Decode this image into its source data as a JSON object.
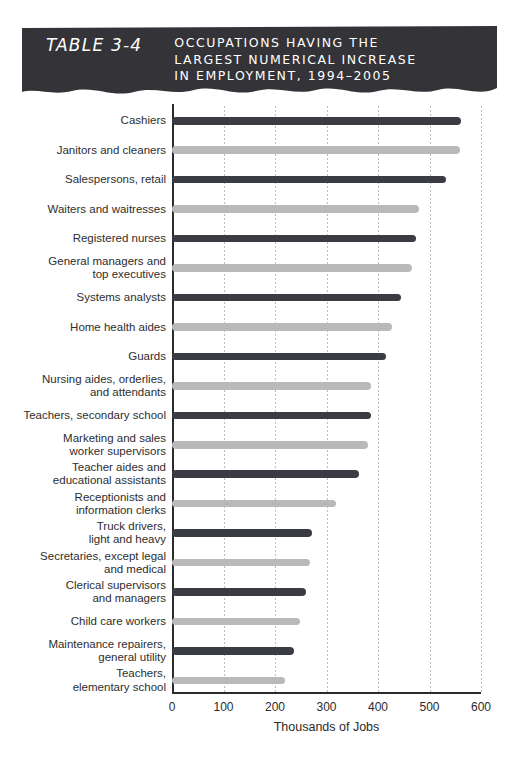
{
  "banner": {
    "label": "TABLE 3-4",
    "title_lines": [
      "OCCUPATIONS HAVING THE",
      "LARGEST NUMERICAL INCREASE",
      "IN EMPLOYMENT, 1994–2005"
    ],
    "background_color": "#333338",
    "text_color": "#ffffff"
  },
  "chart_data": {
    "type": "bar",
    "orientation": "horizontal",
    "title": "OCCUPATIONS HAVING THE LARGEST NUMERICAL INCREASE IN EMPLOYMENT, 1994–2005",
    "xlabel": "Thousands of Jobs",
    "ylabel": "",
    "xlim": [
      0,
      600
    ],
    "xticks": [
      0,
      100,
      200,
      300,
      400,
      500,
      600
    ],
    "xtick_labels": [
      "0",
      "100",
      "200",
      "300",
      "400",
      "500",
      "600"
    ],
    "grid": "vertical-dotted",
    "legend": "none",
    "colors": {
      "dark": "#3a3b43",
      "light": "#b9b9b9",
      "axis": "#2b2b2b",
      "gridline": "#bdbdbd",
      "background": "#ffffff"
    },
    "categories": [
      "Cashiers",
      "Janitors and cleaners",
      "Salespersons, retail",
      "Waiters and waitresses",
      "Registered nurses",
      "General managers and top executives",
      "Systems analysts",
      "Home health aides",
      "Guards",
      "Nursing aides, orderlies, and attendants",
      "Teachers, secondary school",
      "Marketing and sales worker supervisors",
      "Teacher aides and educational assistants",
      "Receptionists and information clerks",
      "Truck drivers, light and heavy",
      "Secretaries, except legal and medical",
      "Clerical supervisors and managers",
      "Child care workers",
      "Maintenance repairers, general utility",
      "Teachers, elementary school"
    ],
    "values": [
      562,
      559,
      532,
      479,
      473,
      466,
      445,
      428,
      415,
      387,
      386,
      380,
      364,
      318,
      271,
      267,
      261,
      248,
      236,
      220
    ]
  },
  "rows": [
    {
      "label_lines": [
        "Cashiers"
      ],
      "value": 562,
      "shade": "dark"
    },
    {
      "label_lines": [
        "Janitors and cleaners"
      ],
      "value": 559,
      "shade": "light"
    },
    {
      "label_lines": [
        "Salespersons, retail"
      ],
      "value": 532,
      "shade": "dark"
    },
    {
      "label_lines": [
        "Waiters and waitresses"
      ],
      "value": 479,
      "shade": "light"
    },
    {
      "label_lines": [
        "Registered nurses"
      ],
      "value": 473,
      "shade": "dark"
    },
    {
      "label_lines": [
        "General managers and",
        "top executives"
      ],
      "value": 466,
      "shade": "light"
    },
    {
      "label_lines": [
        "Systems analysts"
      ],
      "value": 445,
      "shade": "dark"
    },
    {
      "label_lines": [
        "Home health aides"
      ],
      "value": 428,
      "shade": "light"
    },
    {
      "label_lines": [
        "Guards"
      ],
      "value": 415,
      "shade": "dark"
    },
    {
      "label_lines": [
        "Nursing aides, orderlies,",
        "and attendants"
      ],
      "value": 387,
      "shade": "light"
    },
    {
      "label_lines": [
        "Teachers, secondary school"
      ],
      "value": 386,
      "shade": "dark"
    },
    {
      "label_lines": [
        "Marketing and sales",
        "worker supervisors"
      ],
      "value": 380,
      "shade": "light"
    },
    {
      "label_lines": [
        "Teacher aides and",
        "educational assistants"
      ],
      "value": 364,
      "shade": "dark"
    },
    {
      "label_lines": [
        "Receptionists and",
        "information clerks"
      ],
      "value": 318,
      "shade": "light"
    },
    {
      "label_lines": [
        "Truck drivers,",
        "light and heavy"
      ],
      "value": 271,
      "shade": "dark"
    },
    {
      "label_lines": [
        "Secretaries, except legal",
        "and medical"
      ],
      "value": 267,
      "shade": "light"
    },
    {
      "label_lines": [
        "Clerical supervisors",
        "and managers"
      ],
      "value": 261,
      "shade": "dark"
    },
    {
      "label_lines": [
        "Child care workers"
      ],
      "value": 248,
      "shade": "light"
    },
    {
      "label_lines": [
        "Maintenance repairers,",
        "general utility"
      ],
      "value": 236,
      "shade": "dark"
    },
    {
      "label_lines": [
        "Teachers,",
        "elementary school"
      ],
      "value": 220,
      "shade": "light"
    }
  ]
}
